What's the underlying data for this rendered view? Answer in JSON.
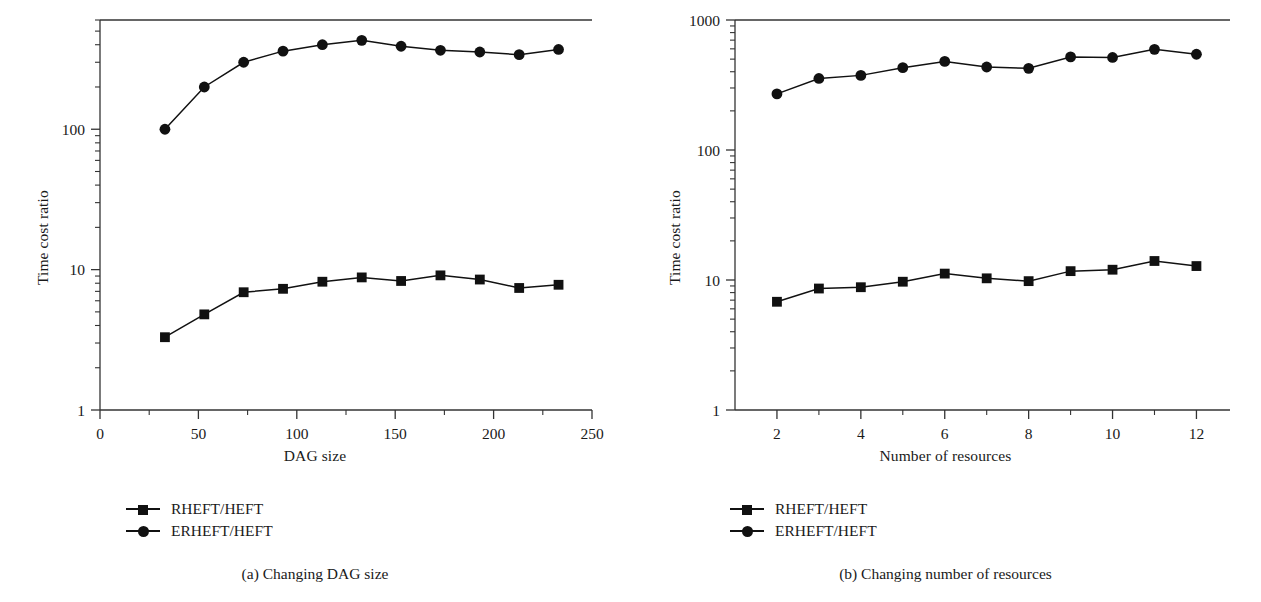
{
  "figure": {
    "panels": [
      {
        "id": "a",
        "caption": "(a)  Changing DAG size",
        "legend": [
          {
            "label": "RHEFT/HEFT",
            "marker": "square"
          },
          {
            "label": "ERHEFT/HEFT",
            "marker": "circle"
          }
        ]
      },
      {
        "id": "b",
        "caption": "(b)  Changing number of resources",
        "legend": [
          {
            "label": "RHEFT/HEFT",
            "marker": "square"
          },
          {
            "label": "ERHEFT/HEFT",
            "marker": "circle"
          }
        ]
      }
    ]
  },
  "chart_data": [
    {
      "type": "line",
      "panel": "a",
      "title": "(a)  Changing DAG size",
      "xlabel": "DAG size",
      "ylabel": "Time cost ratio",
      "xlim": [
        0,
        250
      ],
      "ylim": [
        1,
        600
      ],
      "yscale": "log",
      "xscale": "linear",
      "grid": false,
      "legend_position": "below-left",
      "xticks": [
        0,
        50,
        100,
        150,
        200,
        250
      ],
      "xtick_labels": [
        "0",
        "50",
        "100",
        "150",
        "200",
        "250"
      ],
      "xminor_ticks": [
        25,
        75,
        125,
        175,
        225
      ],
      "yticks": [
        1,
        10,
        100
      ],
      "ytick_labels": [
        "1",
        "10",
        "100"
      ],
      "x": [
        33,
        53,
        73,
        93,
        113,
        133,
        153,
        173,
        193,
        213,
        233
      ],
      "series": [
        {
          "name": "RHEFT/HEFT",
          "marker": "square",
          "values": [
            3.3,
            4.8,
            6.9,
            7.3,
            8.2,
            8.8,
            8.3,
            9.1,
            8.5,
            7.4,
            7.8
          ]
        },
        {
          "name": "ERHEFT/HEFT",
          "marker": "circle",
          "values": [
            100,
            200,
            300,
            360,
            400,
            430,
            390,
            365,
            355,
            340,
            370
          ]
        }
      ]
    },
    {
      "type": "line",
      "panel": "b",
      "title": "(b)  Changing number of resources",
      "xlabel": "Number of resources",
      "ylabel": "Time cost ratio",
      "xlim": [
        1,
        12.8
      ],
      "ylim": [
        1,
        1000
      ],
      "yscale": "log",
      "xscale": "linear",
      "grid": false,
      "legend_position": "below-left",
      "xticks": [
        2,
        4,
        6,
        8,
        10,
        12
      ],
      "xtick_labels": [
        "2",
        "4",
        "6",
        "8",
        "10",
        "12"
      ],
      "xminor_ticks": [
        3,
        5,
        7,
        9,
        11
      ],
      "yticks": [
        1,
        10,
        100,
        1000
      ],
      "ytick_labels": [
        "1",
        "10",
        "100",
        "1000"
      ],
      "x": [
        2,
        3,
        4,
        5,
        6,
        7,
        8,
        9,
        10,
        11,
        12
      ],
      "series": [
        {
          "name": "RHEFT/HEFT",
          "marker": "square",
          "values": [
            6.8,
            8.6,
            8.8,
            9.7,
            11.2,
            10.3,
            9.8,
            11.7,
            12.0,
            14.0,
            12.8
          ]
        },
        {
          "name": "ERHEFT/HEFT",
          "marker": "circle",
          "values": [
            270,
            355,
            375,
            430,
            480,
            435,
            425,
            520,
            515,
            595,
            545
          ]
        }
      ]
    }
  ],
  "colors": {
    "ink": "#1a1a1a",
    "axis": "#333333",
    "marker": "#111111",
    "background": "#ffffff"
  }
}
